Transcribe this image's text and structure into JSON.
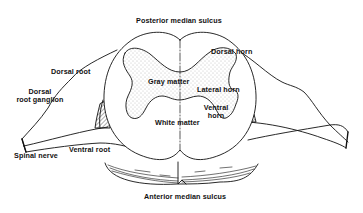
{
  "diagram": {
    "colors": {
      "ink": "#111111",
      "background": "#ffffff",
      "stipple": "#777777"
    },
    "labels": {
      "posterior_median_sulcus": "Posterior median sulcus",
      "anterior_median_sulcus": "Anterior median sulcus",
      "dorsal_root": "Dorsal root",
      "dorsal_root_ganglion_line1": "Dorsal",
      "dorsal_root_ganglion_line2": "root ganglion",
      "spinal_nerve": "Spinal nerve",
      "ventral_root": "Ventral root",
      "gray_matter": "Gray matter",
      "white_matter": "White matter",
      "dorsal_horn": "Dorsal horn",
      "lateral_horn": "Lateral horn",
      "ventral_horn_line1": "Ventral",
      "ventral_horn_line2": "horn"
    }
  }
}
